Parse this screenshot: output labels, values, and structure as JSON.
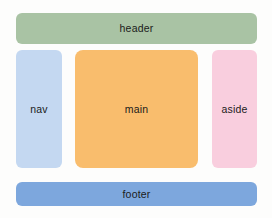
{
  "diagram": {
    "background_color": "#fdfdfc",
    "regions": [
      {
        "key": "header",
        "label": "header",
        "color": "#a9c3a4"
      },
      {
        "key": "nav",
        "label": "nav",
        "color": "#c4d8f1"
      },
      {
        "key": "main",
        "label": "main",
        "color": "#f9bd6d"
      },
      {
        "key": "aside",
        "label": "aside",
        "color": "#f9cede"
      },
      {
        "key": "footer",
        "label": "footer",
        "color": "#7da7dd"
      }
    ]
  }
}
